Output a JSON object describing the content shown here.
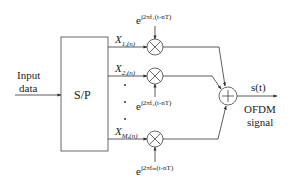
{
  "diagram": {
    "input": {
      "line1": "Input",
      "line2": "data"
    },
    "sp_block": {
      "label": "S/P"
    },
    "branches": [
      {
        "symbol": "X",
        "subscript": "1,(n)",
        "carrier_base": "e",
        "carrier_exponent": "j2πf₁(t-nT)"
      },
      {
        "symbol": "X",
        "subscript": "2,(n)",
        "carrier_base": "e",
        "carrier_exponent": "j2πf₂(t-nT)"
      },
      {
        "symbol": "X",
        "subscript": "M,(n)",
        "carrier_base": "e",
        "carrier_exponent": "j2πfₘ(t-nT)"
      }
    ],
    "adder": {
      "symbol": "+"
    },
    "output": {
      "signal": "s(t)",
      "line1": "OFDM",
      "line2": "signal"
    },
    "colors": {
      "stroke": "#333333",
      "background": "#ffffff"
    }
  }
}
